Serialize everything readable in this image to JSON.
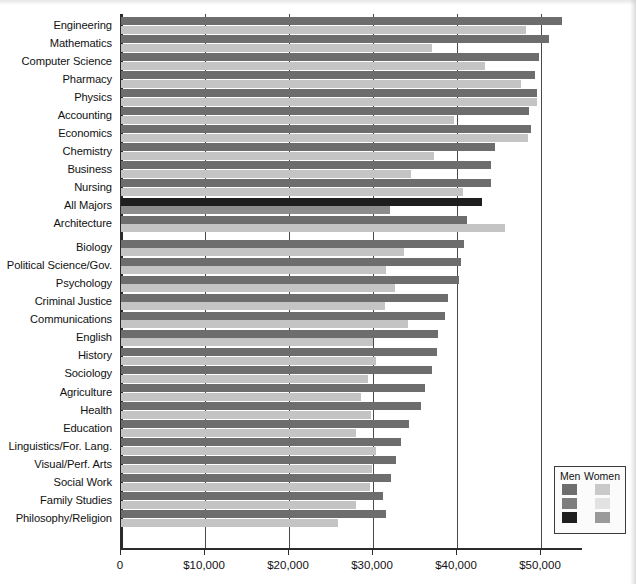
{
  "chart_data": {
    "type": "bar",
    "orientation": "horizontal",
    "title": "",
    "subtitle": "",
    "xlabel": "",
    "ylabel": "",
    "xlim": [
      0,
      55000
    ],
    "grid": true,
    "legend_position": "bottom-right",
    "axis_ticks": [
      {
        "value": 0,
        "label": "0"
      },
      {
        "value": 10000,
        "label": "$10,000"
      },
      {
        "value": 20000,
        "label": "$20,000"
      },
      {
        "value": 30000,
        "label": "$30,000"
      },
      {
        "value": 40000,
        "label": "$40,000"
      },
      {
        "value": 50000,
        "label": "$50,000"
      }
    ],
    "categories": [
      "Engineering",
      "Mathematics",
      "Computer Science",
      "Pharmacy",
      "Physics",
      "Accounting",
      "Economics",
      "Chemistry",
      "Business",
      "Nursing",
      "All Majors",
      "Architecture",
      "Biology",
      "Political Science/Gov.",
      "Psychology",
      "Criminal Justice",
      "Communications",
      "English",
      "History",
      "Sociology",
      "Agriculture",
      "Health",
      "Education",
      "Linguistics/For. Lang.",
      "Visual/Perf. Arts",
      "Social Work",
      "Family Studies",
      "Philosophy/Religion"
    ],
    "series": [
      {
        "name": "Men",
        "values": [
          52500,
          51000,
          49800,
          49300,
          49500,
          48600,
          48800,
          44500,
          44000,
          44100,
          43000,
          41200,
          40800,
          40500,
          40200,
          38900,
          38600,
          37700,
          37600,
          37000,
          36200,
          35700,
          34300,
          33300,
          32700,
          32100,
          31200,
          31600
        ]
      },
      {
        "name": "Women",
        "values": [
          48200,
          37000,
          43300,
          47600,
          49500,
          39700,
          48500,
          37300,
          34500,
          40700,
          32000,
          45700,
          33700,
          31500,
          32600,
          31400,
          34200,
          30000,
          30300,
          29400,
          28600,
          29800,
          28000,
          30400,
          29900,
          29600,
          28000,
          25800
        ]
      }
    ],
    "highlight_category": "All Majors",
    "colors": {
      "men": "#6d6d6d",
      "women": "#c4c4c4",
      "men_highlight": "#1e1e1e",
      "women_highlight": "#8d8d8d",
      "axis": "#2b2b2b",
      "grid": "#4a4a4a",
      "background": "#ffffff"
    }
  },
  "legend": {
    "header_men": "Men",
    "header_women": "Women",
    "rows": [
      {
        "men_color": "#6d6d6d",
        "women_color": "#c9c9c9"
      },
      {
        "men_color": "#7d7d7d",
        "women_color": "#e2e2e2"
      },
      {
        "men_color": "#1e1e1e",
        "women_color": "#9a9a9a"
      }
    ]
  }
}
